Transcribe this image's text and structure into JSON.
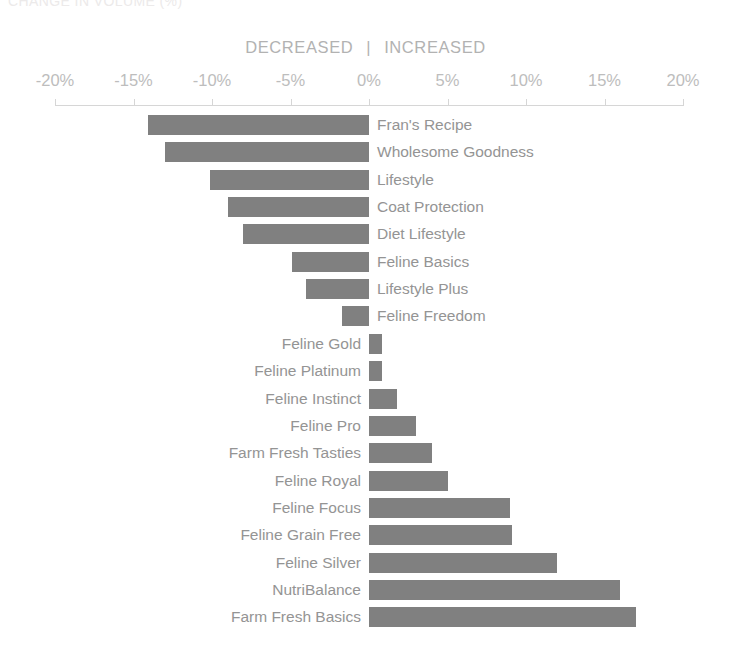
{
  "chart_data": {
    "type": "bar",
    "orientation": "horizontal",
    "title": "CHANGE IN VOLUME (%)",
    "subtitle": "",
    "xlabel": "",
    "ylabel": "",
    "xlim": [
      -20,
      20
    ],
    "x_ticks": [
      -20,
      -15,
      -10,
      -5,
      0,
      5,
      10,
      15,
      20
    ],
    "x_tick_labels": [
      "-20%",
      "-15%",
      "-10%",
      "-5%",
      "0%",
      "5%",
      "10%",
      "15%",
      "20%"
    ],
    "grid": false,
    "legend": "none",
    "bar_color": "#808080",
    "label_color": "#949494",
    "axis_color": "#d6d6d6",
    "direction_labels": {
      "negative": "DECREASED",
      "separator": "|",
      "positive": "INCREASED"
    },
    "categories": [
      "Fran's Recipe",
      "Wholesome Goodness",
      "Lifestyle",
      "Coat Protection",
      "Diet Lifestyle",
      "Feline Basics",
      "Lifestyle Plus",
      "Feline Freedom",
      "Feline Gold",
      "Feline Platinum",
      "Feline Instinct",
      "Feline Pro",
      "Farm Fresh Tasties",
      "Feline Royal",
      "Feline Focus",
      "Feline Grain Free",
      "Feline Silver",
      "NutriBalance",
      "Farm Fresh Basics"
    ],
    "values": [
      -14.1,
      -13.0,
      -10.1,
      -9.0,
      -8.0,
      -4.9,
      -4.0,
      -1.7,
      0.8,
      0.8,
      1.8,
      3.0,
      4.0,
      5.0,
      9.0,
      9.1,
      12.0,
      16.0,
      17.0
    ]
  }
}
